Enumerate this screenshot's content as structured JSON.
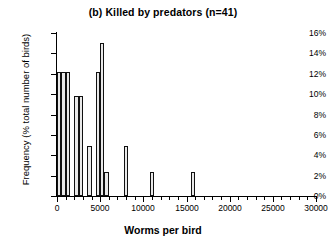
{
  "chart_data": {
    "type": "bar",
    "title": "(b) Killed by predators (n=41)",
    "xlabel": "Worms per bird",
    "ylabel": "Frequency (% total number of birds)",
    "xlim": [
      0,
      30000
    ],
    "ylim": [
      0,
      16
    ],
    "grid": false,
    "legend": null,
    "bin_width": 500,
    "n": 41,
    "y_tick_labels": [
      "0%",
      "2%",
      "4%",
      "6%",
      "8%",
      "10%",
      "12%",
      "14%",
      "16%"
    ],
    "y_tick_values": [
      0,
      2,
      4,
      6,
      8,
      10,
      12,
      14,
      16
    ],
    "x_tick_labels": [
      "0",
      "5000",
      "10000",
      "15000",
      "20000",
      "25000",
      "30000"
    ],
    "x_tick_values": [
      0,
      5000,
      10000,
      15000,
      20000,
      25000,
      30000
    ],
    "x_minor_tick_step": 1000,
    "bin_starts": [
      0,
      500,
      1000,
      1500,
      2000,
      2500,
      3000,
      3500,
      4000,
      4500,
      5000,
      5500,
      6000,
      6500,
      7000,
      7500,
      8000,
      10750,
      13750,
      18750
    ],
    "values": [
      12.2,
      12.2,
      12.2,
      9.8,
      9.8,
      0,
      0,
      4.9,
      0,
      12.2,
      15.0,
      2.4,
      0,
      0,
      0,
      0,
      0,
      4.9,
      2.4,
      2.4
    ],
    "bars": [
      {
        "x": 0,
        "value": 12.2
      },
      {
        "x": 500,
        "value": 12.2
      },
      {
        "x": 1000,
        "value": 12.2
      },
      {
        "x": 2000,
        "value": 9.8
      },
      {
        "x": 2500,
        "value": 9.8
      },
      {
        "x": 3500,
        "value": 4.9
      },
      {
        "x": 4500,
        "value": 12.2
      },
      {
        "x": 5000,
        "value": 15.0
      },
      {
        "x": 5500,
        "value": 2.4
      },
      {
        "x": 7750,
        "value": 4.9
      },
      {
        "x": 10750,
        "value": 2.4
      },
      {
        "x": 15500,
        "value": 2.4
      }
    ]
  },
  "figure": {
    "title": "(b) Killed by predators (n=41)",
    "x_axis_title": "Worms per bird",
    "y_axis_title": "Frequency (% total number of birds)"
  },
  "colors": {
    "bar_fill": "#e9e9e9",
    "bar_stroke": "#111111",
    "axis": "#000000",
    "background": "#ffffff",
    "text": "#000000"
  }
}
